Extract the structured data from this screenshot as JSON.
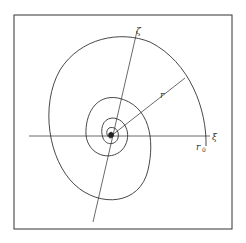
{
  "diagram": {
    "type": "logarithmic-spiral",
    "labels": {
      "xi_axis": "ξ",
      "zeta_axis": "ζ",
      "radius": "r",
      "r0_main": "r",
      "r0_sub": "0"
    },
    "colors": {
      "stroke": "#333333",
      "background": "#ffffff",
      "frame": "#333333"
    }
  }
}
